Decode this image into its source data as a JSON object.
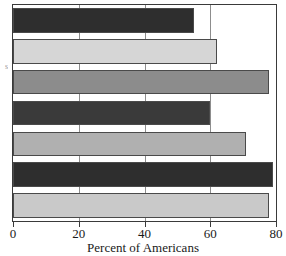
{
  "chart_data": {
    "type": "bar",
    "orientation": "horizontal",
    "title": "",
    "xlabel": "Percent of Americans",
    "ylabel": "",
    "xlim": [
      0,
      80
    ],
    "xticks": [
      0,
      20,
      40,
      60,
      80
    ],
    "xtick_labels": [
      "0",
      "20",
      "40",
      "60",
      "80"
    ],
    "grid": true,
    "legend": "none",
    "categories": [
      "",
      "",
      "",
      "",
      "",
      "",
      ""
    ],
    "values": [
      55,
      62,
      78,
      60,
      71,
      79,
      78
    ],
    "bar_colors": [
      "#2e2e2e",
      "#d6d6d6",
      "#8c8c8c",
      "#3a3a3a",
      "#b0b0b0",
      "#2e2e2e",
      "#c9c9c9"
    ]
  },
  "axis": {
    "x_title": "Percent of Americans",
    "tick_labels": [
      "0",
      "20",
      "40",
      "60",
      "80"
    ],
    "y_label_fragment": "s"
  },
  "colors": {
    "frame": "#3a3a3a",
    "gridline": "#8d8d8d",
    "background": "#ffffff",
    "text": "#1a1a1a"
  }
}
